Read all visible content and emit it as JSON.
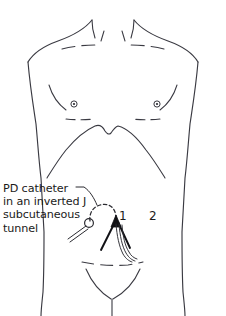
{
  "figure": {
    "background_color": "#ffffff",
    "line_color": "#3a3a42",
    "ink_color": "#1a1a1a",
    "width": 226,
    "height": 316
  },
  "annotation": {
    "lines": [
      "PD catheter",
      "in an inverted J",
      "subcutaneous",
      "tunnel"
    ],
    "leader_line": "leader-line-to-tunnel"
  },
  "markers": {
    "one": "1",
    "two": "2"
  },
  "anatomy": {
    "body_outline": "torso-outline",
    "neck_left": "neck-left-line",
    "neck_right": "neck-right-line",
    "clavicle_left": "clavicle-left-dashed",
    "clavicle_right": "clavicle-right-dashed",
    "nipple_left": "nipple-left",
    "nipple_right": "nipple-right",
    "pectoral_fold_left": "pectoral-fold-left",
    "pectoral_fold_right": "pectoral-fold-right",
    "costal_margin": "costal-margin-curve",
    "pubic_line": "pubic-dashed-line",
    "groin_outline": "groin-v-outline",
    "perineal_line": "perineal-line"
  },
  "catheter": {
    "exit_site": "catheter-exit-site-circle",
    "external_segment": "catheter-external-tubing",
    "tunnel": "inverted-j-subcutaneous-tunnel-dashed",
    "insertion_marker": "catheter-insertion-arrowhead",
    "fan_lines": "catheter-anchor-lines",
    "intraperitoneal_segment": "catheter-intraperitoneal-tubing"
  }
}
